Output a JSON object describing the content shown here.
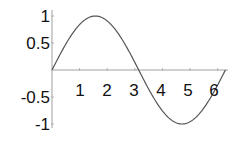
{
  "chart_data": {
    "type": "line",
    "title": "",
    "xlabel": "",
    "ylabel": "",
    "function": "sin(x)",
    "xlim": [
      0,
      6.2832
    ],
    "ylim": [
      -1,
      1
    ],
    "grid": false,
    "legend": null,
    "x_ticks": [
      1,
      2,
      3,
      4,
      5,
      6
    ],
    "x_tick_labels": [
      "1",
      "2",
      "3",
      "4",
      "5",
      "6"
    ],
    "y_ticks": [
      1,
      0.5,
      -0.5,
      -1
    ],
    "y_tick_labels": [
      "1",
      "0.5",
      "-0.5",
      "-1"
    ],
    "series": [
      {
        "name": "sin(x)",
        "x": [
          0,
          0.5,
          1,
          1.5708,
          2,
          2.5,
          3,
          3.1416,
          3.5,
          4,
          4.5,
          4.7124,
          5,
          5.5,
          6,
          6.2832
        ],
        "values": [
          0,
          0.479,
          0.841,
          1,
          0.909,
          0.598,
          0.141,
          0,
          -0.351,
          -0.757,
          -0.978,
          -1,
          -0.959,
          -0.706,
          -0.279,
          0
        ]
      }
    ],
    "colors": {
      "curve": "#555555",
      "axes": "#999999",
      "text": "#111111"
    }
  }
}
